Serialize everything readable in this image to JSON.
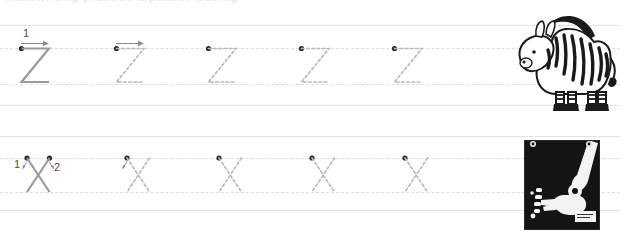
{
  "worksheet": {
    "title_crop": "handwriting practice  alphabet  tracing",
    "background_color": "#ffffff",
    "rule_color": "#e3e3e6",
    "dashed_rule_color": "#dcdce2",
    "trace_color": "#b9b9c2",
    "model_letter_color": "#9a9a9e",
    "dot_color": "#2a2a2a"
  },
  "rows": [
    {
      "id": "row-z",
      "letter": "Z",
      "letter_name": "uppercase-z",
      "stroke_count": 1,
      "stroke_labels": [
        "1"
      ],
      "top_rule_y": 25,
      "mid_rule_y": 48,
      "base_rule_y": 84,
      "bottom_rule_y": 105,
      "letters": [
        {
          "kind": "model",
          "label": "model-letter-z",
          "x": 18,
          "show_number": true,
          "show_arrow": true,
          "show_dot": true
        },
        {
          "kind": "trace",
          "label": "trace-letter-z-1",
          "x": 113,
          "show_number": false,
          "show_arrow": true,
          "show_dot": true
        },
        {
          "kind": "trace",
          "label": "trace-letter-z-2",
          "x": 205,
          "show_number": false,
          "show_arrow": false,
          "show_dot": true
        },
        {
          "kind": "trace",
          "label": "trace-letter-z-3",
          "x": 298,
          "show_number": false,
          "show_arrow": false,
          "show_dot": true
        },
        {
          "kind": "trace",
          "label": "trace-letter-z-4",
          "x": 391,
          "show_number": false,
          "show_arrow": false,
          "show_dot": true
        }
      ]
    },
    {
      "id": "row-x",
      "letter": "X",
      "letter_name": "uppercase-x",
      "stroke_count": 2,
      "stroke_labels": [
        "1",
        "2"
      ],
      "top_rule_y": 136,
      "mid_rule_y": 158,
      "base_rule_y": 192,
      "bottom_rule_y": 210,
      "letters": [
        {
          "kind": "model",
          "label": "model-letter-x",
          "x": 18,
          "show_number": true,
          "show_arrow": true,
          "show_dot": true
        },
        {
          "kind": "trace",
          "label": "trace-letter-x-1",
          "x": 113,
          "show_number": false,
          "show_arrow": true,
          "show_dot": true
        },
        {
          "kind": "trace",
          "label": "trace-letter-x-2",
          "x": 205,
          "show_number": false,
          "show_arrow": false,
          "show_dot": true
        },
        {
          "kind": "trace",
          "label": "trace-letter-x-3",
          "x": 298,
          "show_number": false,
          "show_arrow": false,
          "show_dot": true
        },
        {
          "kind": "trace",
          "label": "trace-letter-x-4",
          "x": 391,
          "show_number": false,
          "show_arrow": false,
          "show_dot": true
        }
      ]
    }
  ],
  "pictures": [
    {
      "id": "zebra",
      "name": "zebra-illustration",
      "alt": "Zebra",
      "caption": "",
      "x": 512,
      "y": 12,
      "width": 104,
      "height": 104
    },
    {
      "id": "xray",
      "name": "xray-photograph",
      "alt": "X-ray of an ankle and foot",
      "caption": "",
      "x": 524,
      "y": 140,
      "width": 74,
      "height": 88,
      "frame_color": "#141414"
    }
  ]
}
